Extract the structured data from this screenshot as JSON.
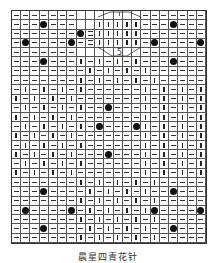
{
  "chart": {
    "columns": 21,
    "rows": 25,
    "legend_note": "- purl, | knit, o bobble, = cable-cross, blank = no stitch",
    "grid": [
      "-------  .....-------",
      "---o---  |||||---o---",
      "-------o=|||||-------",
      "-o----o-=|||||-o----o",
      "-------  .....-------",
      "---o---|-|-|-|---o---",
      "--------|-|-|-|------",
      "-------|-|-|-|-|-----",
      "-|-|-|-|------|-|-|-|",
      "|-|-|-|-------|-|-|-|",
      "-|-|-|-|--o---|-|-|-|",
      "|-|-|-|-------|-|-|-|",
      "-|-|-|-|-o---o|-|-|-|",
      "|-|-|-|-------|-|-|-|",
      "-|-|-|-|------|-|-|-|",
      "|-|-|-|---o---|-|-|-|",
      "-|-|-|-|------|-|-|-|",
      "|-|-|-|-------|-|-|-|",
      "-------|-|-|-|-|-----",
      "---o----|-|-|-|--o---",
      "-------|-|-|-|-|-----",
      "-o----o-|-|-|-|o----o",
      "-------|-|-|-|-|-----",
      "---o----|-|-|-|--o---",
      "-------|-|-|-|-|-----"
    ],
    "cable_label": "5"
  },
  "caption": "晨星四青花针"
}
